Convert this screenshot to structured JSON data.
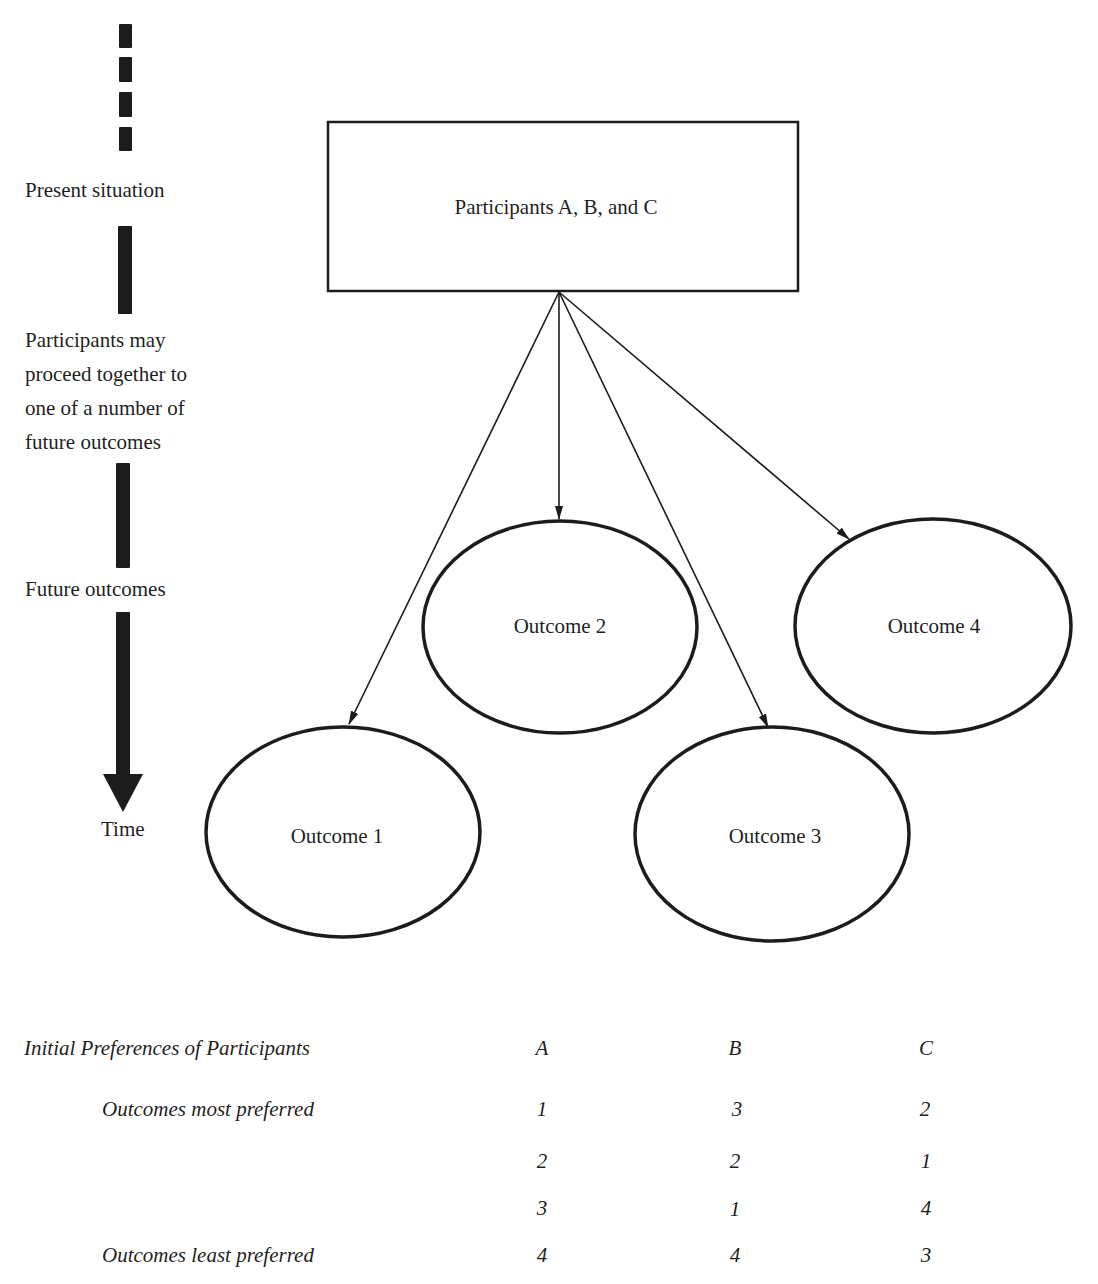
{
  "timeline": {
    "present_label": "Present situation",
    "transition_label": "Participants may\nproceed together to\none of a number of\nfuture outcomes",
    "future_label": "Future outcomes",
    "time_label": "Time"
  },
  "diagram": {
    "source_box": {
      "label": "Participants A, B, and C"
    },
    "outcomes": [
      {
        "id": 1,
        "label": "Outcome 1"
      },
      {
        "id": 2,
        "label": "Outcome 2"
      },
      {
        "id": 3,
        "label": "Outcome 3"
      },
      {
        "id": 4,
        "label": "Outcome 4"
      }
    ],
    "edges": [
      {
        "from": "Participants A, B, and C",
        "to": "Outcome 1"
      },
      {
        "from": "Participants A, B, and C",
        "to": "Outcome 2"
      },
      {
        "from": "Participants A, B, and C",
        "to": "Outcome 3"
      },
      {
        "from": "Participants A, B, and C",
        "to": "Outcome 4"
      }
    ]
  },
  "preferences": {
    "title": "Initial Preferences of Participants",
    "columns": [
      "A",
      "B",
      "C"
    ],
    "row_labels": [
      "Outcomes most preferred",
      "",
      "",
      "Outcomes least preferred"
    ],
    "rows": [
      [
        "1",
        "3",
        "2"
      ],
      [
        "2",
        "2",
        "1"
      ],
      [
        "3",
        "1",
        "4"
      ],
      [
        "4",
        "4",
        "3"
      ]
    ]
  }
}
